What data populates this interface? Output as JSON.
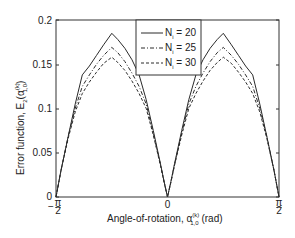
{
  "chart_data": {
    "type": "line",
    "title": "",
    "xlabel": "Angle-of-rotation, α_{1,0}^{(k)} (rad)",
    "ylabel": "Error function, E_2(α_{1,0}^{(k)})",
    "xlim": [
      -1.5708,
      1.5708
    ],
    "ylim": [
      0,
      0.2
    ],
    "grid": false,
    "legend_position": "upper center",
    "x_ticks": [
      {
        "value": -1.5708,
        "label": "-π/2"
      },
      {
        "value": 0,
        "label": "0"
      },
      {
        "value": 1.5708,
        "label": "π/2"
      }
    ],
    "y_ticks": [
      {
        "value": 0,
        "label": "0"
      },
      {
        "value": 0.05,
        "label": "0.05"
      },
      {
        "value": 0.1,
        "label": "0.1"
      },
      {
        "value": 0.15,
        "label": "0.15"
      },
      {
        "value": 0.2,
        "label": "0.2"
      }
    ],
    "x": [
      -1.5708,
      -1.5,
      -1.4,
      -1.3,
      -1.2,
      -1.1,
      -1.0,
      -0.9,
      -0.7854,
      -0.7,
      -0.6,
      -0.5,
      -0.4,
      -0.3,
      -0.2,
      -0.1,
      -0.05,
      0,
      0.05,
      0.1,
      0.2,
      0.3,
      0.4,
      0.5,
      0.6,
      0.7,
      0.7854,
      0.9,
      1.0,
      1.1,
      1.2,
      1.3,
      1.4,
      1.5,
      1.5708
    ],
    "series": [
      {
        "name": "N_i = 20",
        "style": "solid",
        "values": [
          0.0,
          0.03,
          0.068,
          0.105,
          0.138,
          0.148,
          0.16,
          0.172,
          0.185,
          0.178,
          0.168,
          0.155,
          0.138,
          0.11,
          0.075,
          0.038,
          0.018,
          0.0,
          0.018,
          0.038,
          0.075,
          0.11,
          0.138,
          0.155,
          0.168,
          0.178,
          0.185,
          0.172,
          0.16,
          0.148,
          0.138,
          0.105,
          0.068,
          0.03,
          0.0
        ]
      },
      {
        "name": "N_i = 25",
        "style": "dash-dot",
        "values": [
          0.0,
          0.03,
          0.068,
          0.1,
          0.125,
          0.138,
          0.15,
          0.16,
          0.169,
          0.163,
          0.153,
          0.14,
          0.125,
          0.105,
          0.072,
          0.037,
          0.018,
          0.0,
          0.018,
          0.037,
          0.072,
          0.105,
          0.125,
          0.14,
          0.153,
          0.163,
          0.169,
          0.16,
          0.15,
          0.138,
          0.125,
          0.1,
          0.068,
          0.03,
          0.0
        ]
      },
      {
        "name": "N_i = 30",
        "style": "dashed",
        "values": [
          0.0,
          0.03,
          0.066,
          0.096,
          0.117,
          0.13,
          0.141,
          0.151,
          0.158,
          0.152,
          0.143,
          0.131,
          0.117,
          0.1,
          0.07,
          0.036,
          0.017,
          0.0,
          0.017,
          0.036,
          0.07,
          0.1,
          0.117,
          0.131,
          0.143,
          0.152,
          0.158,
          0.151,
          0.141,
          0.13,
          0.117,
          0.096,
          0.066,
          0.03,
          0.0
        ]
      }
    ]
  },
  "labels": {
    "x_axis_main": "Angle-of-rotation,  α",
    "x_axis_sup": "(k)",
    "x_axis_sub": "1,0",
    "x_axis_unit": " (rad)",
    "y_axis_main": "Error function,  E",
    "y_axis_sub2": "2",
    "y_axis_paren_open": "(α",
    "y_axis_sup": "(k)",
    "y_axis_sub": "1,0",
    "y_axis_paren_close": ")",
    "x_tick_left_num": "π",
    "x_tick_left_den": "2",
    "x_tick_left_sign": "−",
    "x_tick_mid": "0",
    "x_tick_right_num": "π",
    "x_tick_right_den": "2",
    "y_tick_0": "0",
    "y_tick_1": "0.05",
    "y_tick_2": "0.1",
    "y_tick_3": "0.15",
    "y_tick_4": "0.2"
  },
  "legend": {
    "items": [
      {
        "symbol": "N",
        "sub": "i",
        "eq": " = 20"
      },
      {
        "symbol": "N",
        "sub": "i",
        "eq": " = 25"
      },
      {
        "symbol": "N",
        "sub": "i",
        "eq": " = 30"
      }
    ]
  },
  "colors": {
    "line": "#2a2a2a",
    "axis": "#333333",
    "background": "#ffffff"
  }
}
